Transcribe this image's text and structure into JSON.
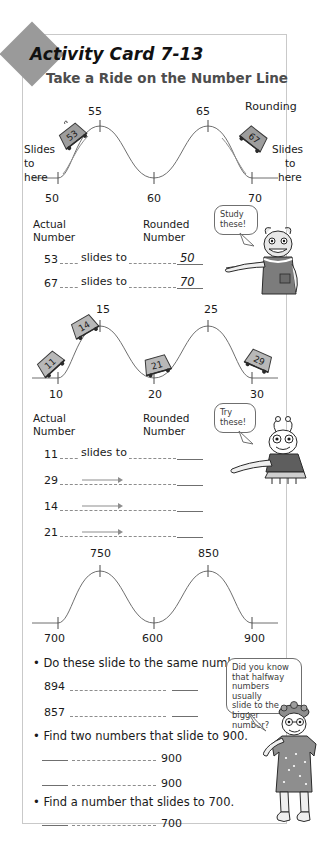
{
  "card": {
    "badge_label": "Activity Card 7-13",
    "title": "Take a Ride on the Number Line"
  },
  "section1": {
    "ticks": [
      "50",
      "60",
      "70"
    ],
    "peaks": [
      "55",
      "65"
    ],
    "rounding_label": "Rounding",
    "slides_left": "Slides\nto\nhere",
    "slides_left_l1": "Slides",
    "slides_left_l2": "to",
    "slides_left_l3": "here",
    "slides_right_l1": "Slides",
    "slides_right_l2": "to",
    "slides_right_l3": "here",
    "sled_left_number": "53",
    "sled_right_number": "67",
    "table": {
      "header_actual_l1": "Actual",
      "header_actual_l2": "Number",
      "header_rounded_l1": "Rounded",
      "header_rounded_l2": "Number",
      "connector_label": "slides to",
      "rows": [
        {
          "actual": "53",
          "connector": "slides to",
          "rounded": "50"
        },
        {
          "actual": "67",
          "connector": "slides to",
          "rounded": "70"
        }
      ]
    },
    "bubble_l1": "Study",
    "bubble_l2": "these!"
  },
  "section2": {
    "ticks": [
      "10",
      "20",
      "30"
    ],
    "peaks": [
      "15",
      "25"
    ],
    "sleds": [
      "11",
      "14",
      "21",
      "29"
    ],
    "table": {
      "header_actual_l1": "Actual",
      "header_actual_l2": "Number",
      "header_rounded_l1": "Rounded",
      "header_rounded_l2": "Number",
      "connector_label": "slides to",
      "rows": [
        {
          "actual": "11",
          "connector": "slides to",
          "rounded": ""
        },
        {
          "actual": "29",
          "connector": "",
          "rounded": ""
        },
        {
          "actual": "14",
          "connector": "",
          "rounded": ""
        },
        {
          "actual": "21",
          "connector": "",
          "rounded": ""
        }
      ]
    },
    "bubble_l1": "Try",
    "bubble_l2": "these!"
  },
  "section3": {
    "ticks": [
      "700",
      "600",
      "900"
    ],
    "peaks": [
      "750",
      "850"
    ]
  },
  "questions": {
    "q1": "• Do these slide to the same number?",
    "q1_rows": [
      "894",
      "857"
    ],
    "q2": "• Find two numbers that slide to 900.",
    "q2_targets": [
      "900",
      "900"
    ],
    "q3": "• Find a number that slides to 700.",
    "q3_target": "700",
    "bubble_lines": [
      "Did you know",
      "that halfway",
      "numbers usually",
      "slide to the",
      "bigger number?"
    ]
  }
}
